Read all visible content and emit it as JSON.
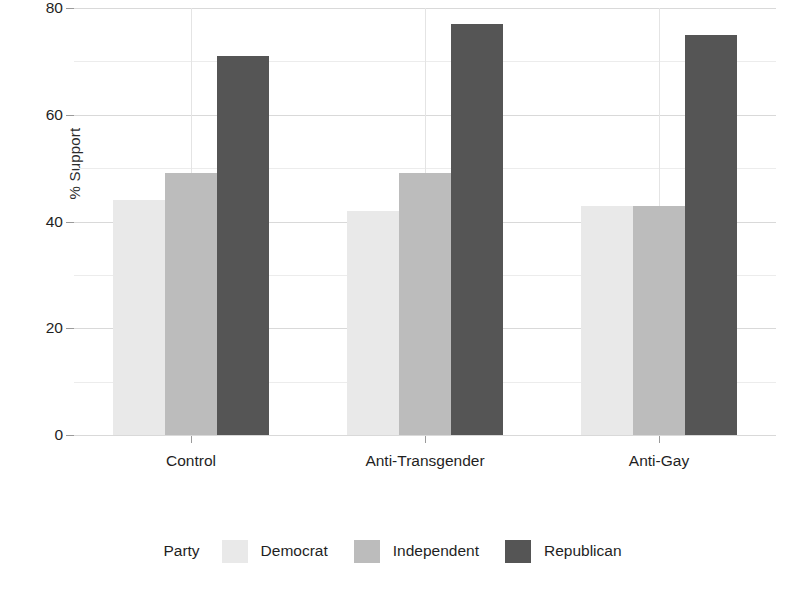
{
  "chart_data": {
    "type": "bar",
    "title": "",
    "subtitle": "",
    "xlabel": "",
    "ylabel": "% Support",
    "categories": [
      "Control",
      "Anti-Transgender",
      "Anti-Gay"
    ],
    "series": [
      {
        "name": "Democrat",
        "color": "#e9e9e9",
        "values": [
          44,
          42,
          43
        ]
      },
      {
        "name": "Independent",
        "color": "#bcbcbc",
        "values": [
          49,
          49,
          43
        ]
      },
      {
        "name": "Republican",
        "color": "#555555",
        "values": [
          71,
          77,
          75
        ]
      }
    ],
    "ylim": [
      0,
      80
    ],
    "yticks": [
      0,
      20,
      40,
      60,
      80
    ],
    "ytick_labels": [
      "0",
      "20",
      "40",
      "60",
      "80"
    ],
    "yminor_ticks": [
      10,
      30,
      50,
      70
    ],
    "grid": true,
    "grid_axis": "both",
    "legend": {
      "title": "Party",
      "position": "bottom",
      "orientation": "horizontal",
      "entries": [
        "Democrat",
        "Independent",
        "Republican"
      ]
    },
    "bar_mode": "grouped",
    "background": "#ffffff"
  }
}
